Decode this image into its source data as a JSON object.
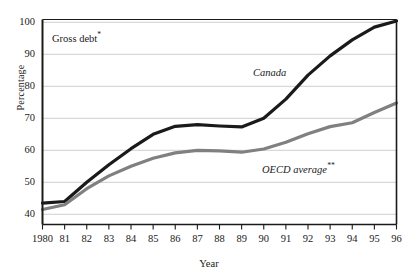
{
  "chart_data": {
    "type": "line",
    "title": "",
    "xlabel": "Year",
    "ylabel": "Percentage",
    "ylim": [
      38,
      104
    ],
    "yticks": [
      40,
      50,
      60,
      70,
      80,
      90,
      100
    ],
    "grid": true,
    "legend": "inline-labels",
    "x": [
      1980,
      1981,
      1982,
      1983,
      1984,
      1985,
      1986,
      1987,
      1988,
      1989,
      1990,
      1991,
      1992,
      1993,
      1994,
      1995,
      1996
    ],
    "xtick_labels": [
      "1980",
      "81",
      "82",
      "83",
      "84",
      "85",
      "86",
      "87",
      "88",
      "89",
      "90",
      "91",
      "92",
      "93",
      "94",
      "95",
      "96"
    ],
    "series": [
      {
        "name": "Canada",
        "color": "#1a1a1a",
        "width": 3.2,
        "values": [
          43.5,
          44.0,
          50.0,
          55.5,
          60.5,
          65.0,
          67.5,
          68.0,
          67.6,
          67.3,
          70.0,
          76.0,
          83.5,
          89.5,
          94.5,
          98.5,
          100.4
        ]
      },
      {
        "name": "OECD average",
        "color": "#808080",
        "width": 3.2,
        "values": [
          41.5,
          43.0,
          48.0,
          52.0,
          55.0,
          57.5,
          59.2,
          60.0,
          59.8,
          59.4,
          60.4,
          62.5,
          65.2,
          67.4,
          68.6,
          71.8,
          74.8
        ]
      }
    ],
    "annotations": [
      {
        "id": "gross-debt",
        "text": "Gross debt",
        "marker": "*",
        "style": "roman"
      },
      {
        "id": "canada",
        "text": "Canada",
        "marker": "",
        "style": "italic"
      },
      {
        "id": "oecd",
        "text": "OECD average",
        "marker": "**",
        "style": "italic"
      }
    ]
  },
  "labels": {
    "y_axis_title": "Percentage",
    "x_axis_title": "Year",
    "gross_debt": "Gross debt",
    "gross_debt_marker": "*",
    "canada": "Canada",
    "oecd": "OECD average",
    "oecd_marker": "**"
  }
}
